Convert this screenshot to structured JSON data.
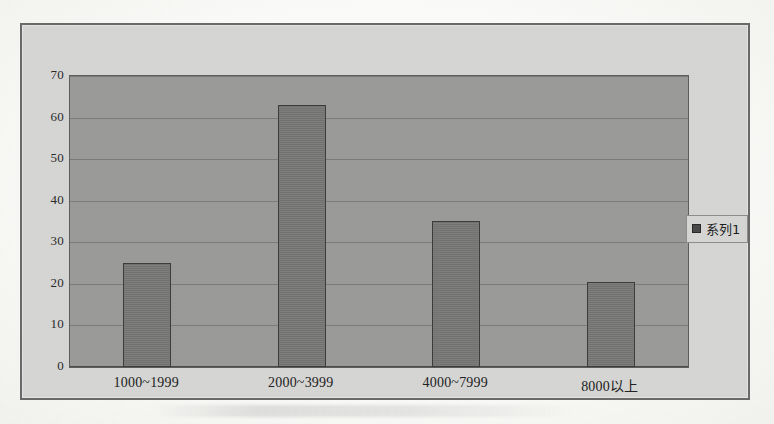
{
  "chart_data": {
    "type": "bar",
    "title": "",
    "xlabel": "",
    "ylabel": "",
    "categories": [
      "1000~1999",
      "2000~3999",
      "4000~7999",
      "8000以上"
    ],
    "series": [
      {
        "name": "系列1",
        "values": [
          25,
          63,
          35,
          20.5
        ]
      }
    ],
    "values": [
      25,
      63,
      35,
      20.5
    ],
    "ylim": [
      0,
      70
    ],
    "ytick_step": 10,
    "yticks": [
      "70",
      "60",
      "50",
      "40",
      "30",
      "20",
      "10",
      "0"
    ],
    "grid": true,
    "legend": {
      "position": "right",
      "entries": [
        "系列1"
      ]
    },
    "colors": {
      "bar_fill": "#787877",
      "bar_border": "#3d3d3d",
      "plot_background": "#9b9b99",
      "frame_background": "#d6d6d4",
      "frame_border": "#6a6a6a",
      "gridline": "#77777a",
      "text": "#222222"
    }
  },
  "legend": {
    "swatch_icon": "legend-swatch-icon",
    "label": "系列1"
  },
  "axes": {
    "y_labels": [
      "70",
      "60",
      "50",
      "40",
      "30",
      "20",
      "10",
      "0"
    ],
    "x_labels": [
      "1000~1999",
      "2000~3999",
      "4000~7999",
      "8000以上"
    ]
  }
}
